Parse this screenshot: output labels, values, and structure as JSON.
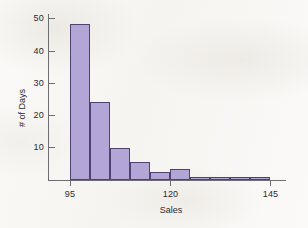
{
  "chart_data": {
    "type": "bar",
    "title": "",
    "subtitle": "",
    "xlabel": "Sales",
    "ylabel": "# of Days",
    "xlim": [
      95,
      145
    ],
    "ylim": [
      0,
      52
    ],
    "grid": false,
    "legend": null,
    "bin_width": 5,
    "x_ticks": [
      95,
      120,
      145
    ],
    "x_tick_labels": [
      "95",
      "120",
      "145"
    ],
    "y_ticks": [
      10,
      20,
      30,
      40,
      50
    ],
    "y_tick_labels": [
      "10",
      "20",
      "30",
      "40",
      "50"
    ],
    "categories": [
      "95-100",
      "100-105",
      "105-110",
      "110-115",
      "115-120",
      "120-125",
      "125-130",
      "130-135",
      "135-140",
      "140-145"
    ],
    "bin_starts": [
      95,
      100,
      105,
      110,
      115,
      120,
      125,
      130,
      135,
      140
    ],
    "values": [
      48,
      24,
      10,
      5.5,
      2.5,
      3.5,
      0.5,
      0.5,
      0.5,
      0.5
    ],
    "colors": {
      "bar_fill": "#b3a6d6",
      "bar_edge": "#4e4370",
      "axis": "#6e6e72",
      "text": "#2b2b30",
      "background": "#faf9f7"
    }
  }
}
